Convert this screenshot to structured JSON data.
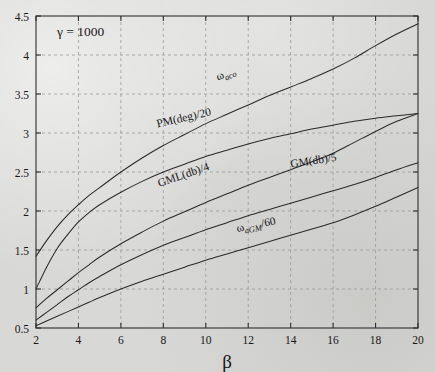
{
  "chart_data": {
    "type": "line",
    "title": "",
    "subtitle": "",
    "xlabel": "β",
    "ylabel": "",
    "xlim": [
      2,
      20
    ],
    "ylim": [
      0.5,
      4.5
    ],
    "xticks": [
      2,
      4,
      6,
      8,
      10,
      12,
      14,
      16,
      18,
      20
    ],
    "xtick_labels": [
      "2",
      "4",
      "6",
      "8",
      "10",
      "12",
      "14",
      "16",
      "18",
      "20"
    ],
    "yticks": [
      0.5,
      1,
      1.5,
      2,
      2.5,
      3,
      3.5,
      4,
      4.5
    ],
    "ytick_labels": [
      "0.5",
      "1",
      "1.5",
      "2",
      "2.5",
      "3",
      "3.5",
      "4",
      "4.5"
    ],
    "grid": true,
    "grid_style": "dashed",
    "legend_position": "inline-curve-labels",
    "annotations": [
      {
        "name": "gamma-annotation",
        "text": "γ = 1000",
        "x": 4.1,
        "y": 4.24
      }
    ],
    "x": [
      2,
      2.5,
      3,
      3.5,
      4,
      4.5,
      5,
      6,
      7,
      8,
      9,
      10,
      11,
      12,
      13,
      14,
      15,
      16,
      17,
      18,
      19,
      20
    ],
    "series": [
      {
        "name": "omega_aco",
        "label": "ω",
        "label_sub": "aco",
        "label_tail": "",
        "label_x": 11.0,
        "label_y": 3.72,
        "label_rotation": -21,
        "values": [
          1.42,
          1.62,
          1.8,
          1.95,
          2.08,
          2.2,
          2.3,
          2.5,
          2.68,
          2.84,
          2.98,
          3.12,
          3.24,
          3.36,
          3.48,
          3.59,
          3.7,
          3.82,
          3.96,
          4.12,
          4.27,
          4.4
        ]
      },
      {
        "name": "pm_deg_over_20",
        "label": "PM(deg)/20",
        "label_sub": "",
        "label_tail": "",
        "label_x": 9.0,
        "label_y": 3.15,
        "label_rotation": -13,
        "values": [
          1.0,
          1.28,
          1.52,
          1.7,
          1.86,
          1.98,
          2.08,
          2.24,
          2.38,
          2.5,
          2.6,
          2.7,
          2.78,
          2.86,
          2.93,
          2.99,
          3.05,
          3.1,
          3.15,
          3.19,
          3.22,
          3.25
        ]
      },
      {
        "name": "gml_db_over_4",
        "label": "GML(db)/4",
        "label_sub": "",
        "label_tail": "",
        "label_x": 9.0,
        "label_y": 2.42,
        "label_rotation": -19,
        "values": [
          0.76,
          0.88,
          0.99,
          1.1,
          1.21,
          1.31,
          1.41,
          1.58,
          1.73,
          1.87,
          1.99,
          2.11,
          2.22,
          2.33,
          2.43,
          2.53,
          2.63,
          2.74,
          2.88,
          3.02,
          3.15,
          3.25
        ]
      },
      {
        "name": "gm_db_over_5",
        "label": "GM(db)/5",
        "label_sub": "",
        "label_tail": "",
        "label_x": 15.1,
        "label_y": 2.6,
        "label_rotation": -9,
        "values": [
          0.6,
          0.7,
          0.8,
          0.9,
          0.99,
          1.08,
          1.16,
          1.31,
          1.44,
          1.56,
          1.66,
          1.76,
          1.85,
          1.94,
          2.02,
          2.1,
          2.18,
          2.26,
          2.34,
          2.43,
          2.53,
          2.62
        ]
      },
      {
        "name": "omega_aGM_over_60",
        "label": "ω",
        "label_sub": "aGM",
        "label_tail": "/60",
        "label_x": 12.4,
        "label_y": 1.78,
        "label_rotation": -11,
        "values": [
          0.53,
          0.59,
          0.65,
          0.71,
          0.77,
          0.83,
          0.89,
          1.0,
          1.1,
          1.19,
          1.28,
          1.37,
          1.45,
          1.53,
          1.61,
          1.69,
          1.77,
          1.85,
          1.95,
          2.06,
          2.18,
          2.3
        ]
      }
    ],
    "colors": {
      "curve": "#2a2a2c",
      "grid": "#9a9a98",
      "axis": "#2f2f31",
      "text": "#17171a",
      "background": "#d8d8d6"
    }
  }
}
